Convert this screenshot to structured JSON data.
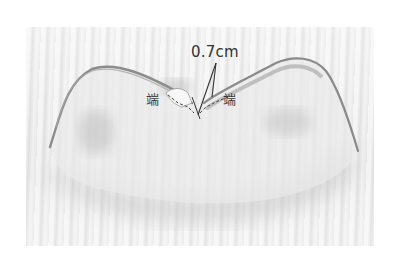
{
  "image": {
    "subject": "fabric-piece-with-seam-notch",
    "description": "Light fabric piece with two rounded shoulder peaks and a central notch, annotated with seam measurement and end labels"
  },
  "annotations": {
    "measurement": "0.7cm",
    "end_label_left": "端",
    "end_label_right": "端"
  },
  "colors": {
    "background": "#ffffff",
    "photo_base": "#ececec",
    "fabric_edge": "#8a8a8a",
    "fabric_shadow": "#bdbdbd",
    "annotation_ink": "#333333"
  }
}
